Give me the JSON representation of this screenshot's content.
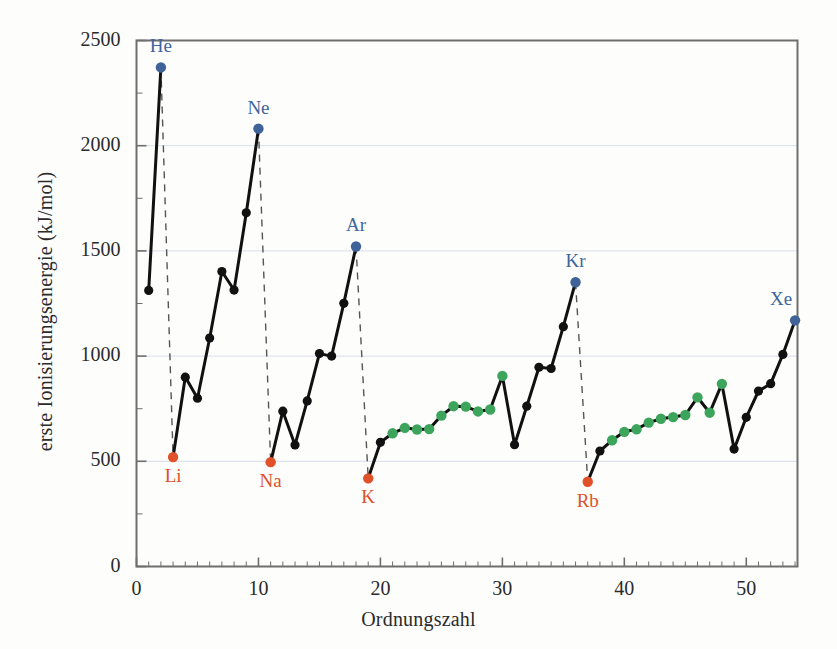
{
  "chart_data": {
    "type": "line",
    "title": "",
    "xlabel": "Ordnungszahl",
    "ylabel": "erste Ionisierungsenergie (kJ/mol)",
    "xlim": [
      0,
      54.2
    ],
    "ylim": [
      0,
      2500
    ],
    "xticks": [
      0,
      10,
      20,
      30,
      40,
      50
    ],
    "yticks": [
      0,
      500,
      1000,
      1500,
      2000,
      2500
    ],
    "xtick_labels": [
      "0",
      "10",
      "20",
      "30",
      "40",
      "50"
    ],
    "ytick_labels": [
      "0",
      "500",
      "1000",
      "1500",
      "2000",
      "2500"
    ],
    "x_minor_step": 1,
    "y_minor_step": 250,
    "grid": "horizontal-major-only",
    "legend": "none",
    "series": [
      {
        "name": "erste Ionisierungsenergie",
        "x": [
          1,
          2,
          3,
          4,
          5,
          6,
          7,
          8,
          9,
          10,
          11,
          12,
          13,
          14,
          15,
          16,
          17,
          18,
          19,
          20,
          21,
          22,
          23,
          24,
          25,
          26,
          27,
          28,
          29,
          30,
          31,
          32,
          33,
          34,
          35,
          36,
          37,
          38,
          39,
          40,
          41,
          42,
          43,
          44,
          45,
          46,
          47,
          48,
          49,
          50,
          51,
          52,
          53,
          54
        ],
        "values": [
          1312,
          2372,
          520,
          900,
          800,
          1086,
          1402,
          1314,
          1681,
          2081,
          496,
          738,
          578,
          787,
          1012,
          1000,
          1251,
          1521,
          419,
          590,
          633,
          659,
          651,
          653,
          717,
          762,
          760,
          737,
          746,
          906,
          579,
          762,
          947,
          941,
          1140,
          1351,
          403,
          549,
          600,
          640,
          652,
          684,
          702,
          710,
          720,
          804,
          731,
          868,
          558,
          709,
          834,
          869,
          1008,
          1170
        ],
        "point_colors": [
          "black",
          "noble",
          "alkali",
          "black",
          "black",
          "black",
          "black",
          "black",
          "black",
          "noble",
          "alkali",
          "black",
          "black",
          "black",
          "black",
          "black",
          "black",
          "noble",
          "alkali",
          "black",
          "green",
          "green",
          "green",
          "green",
          "green",
          "green",
          "green",
          "green",
          "green",
          "green",
          "black",
          "black",
          "black",
          "black",
          "black",
          "noble",
          "alkali",
          "black",
          "green",
          "green",
          "green",
          "green",
          "green",
          "green",
          "green",
          "green",
          "green",
          "green",
          "black",
          "black",
          "black",
          "black",
          "black",
          "noble"
        ]
      }
    ],
    "annotations": [
      {
        "label": "He",
        "x": 2,
        "value": 2372,
        "kind": "noble"
      },
      {
        "label": "Ne",
        "x": 10,
        "value": 2081,
        "kind": "noble"
      },
      {
        "label": "Ar",
        "x": 18,
        "value": 1521,
        "kind": "noble"
      },
      {
        "label": "Kr",
        "x": 36,
        "value": 1351,
        "kind": "noble"
      },
      {
        "label": "Xe",
        "x": 54,
        "value": 1170,
        "kind": "noble"
      },
      {
        "label": "Li",
        "x": 3,
        "value": 520,
        "kind": "alkali"
      },
      {
        "label": "Na",
        "x": 11,
        "value": 496,
        "kind": "alkali"
      },
      {
        "label": "K",
        "x": 19,
        "value": 419,
        "kind": "alkali"
      },
      {
        "label": "Rb",
        "x": 37,
        "value": 403,
        "kind": "alkali"
      }
    ],
    "dashed_drops": [
      {
        "from_x": 2,
        "from_value": 2372,
        "to_x": 3,
        "to_value": 520
      },
      {
        "from_x": 10,
        "from_value": 2081,
        "to_x": 11,
        "to_value": 496
      },
      {
        "from_x": 18,
        "from_value": 1521,
        "to_x": 19,
        "to_value": 419
      },
      {
        "from_x": 36,
        "from_value": 1351,
        "to_x": 37,
        "to_value": 403
      }
    ],
    "colors": {
      "line": "#111111",
      "point_black": "#111111",
      "point_noble": "#3f6399",
      "point_alkali": "#e0512a",
      "point_green": "#3da45c",
      "label_noble": "#41659c",
      "label_alkali": "#e0512a",
      "grid": "#d8dde5",
      "frame": "#6e6e6e",
      "background": "#fdfdfc"
    }
  }
}
